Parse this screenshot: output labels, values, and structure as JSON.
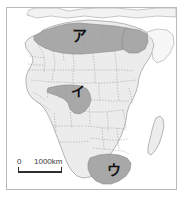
{
  "figure": {
    "type": "thematic-map",
    "frame_border_color": "#b9b9b9",
    "background_color": "#ffffff"
  },
  "map": {
    "land_color": "#ececec",
    "highlight_color": "#a8a8a8",
    "coast_line_color": "#8c8c8c",
    "border_line_color": "#9a9a9a",
    "ocean_color": "#ffffff",
    "regions": [
      {
        "id": "region-north",
        "label": "ア",
        "description": "North Africa highlighted area",
        "label_x": 72,
        "label_y": 33
      },
      {
        "id": "region-gulf-of-guinea",
        "label": "イ",
        "description": "Gulf of Guinea / West Africa highlighted area",
        "label_x": 71,
        "label_y": 88
      },
      {
        "id": "region-south",
        "label": "ウ",
        "description": "Southern Africa highlighted area",
        "label_x": 107,
        "label_y": 167
      }
    ]
  },
  "scale": {
    "zero_label": "0",
    "distance_label": "1000km"
  }
}
